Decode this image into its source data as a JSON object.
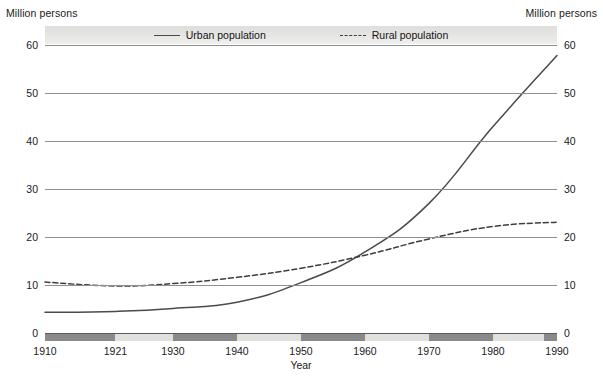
{
  "labels": {
    "unit_left": "Million persons",
    "unit_right": "Million persons"
  },
  "legend": {
    "position": "top-center",
    "entries": [
      {
        "label": "Urban population",
        "style": "solid",
        "color": "#4a4a4a"
      },
      {
        "label": "Rural population",
        "style": "dashed",
        "color": "#3d3d3d"
      }
    ]
  },
  "axes": {
    "x_title": "Year",
    "x_ticks": [
      "1910",
      "1921",
      "1930",
      "1940",
      "1950",
      "1960",
      "1970",
      "1980",
      "1990"
    ],
    "y_ticks_left": [
      "60",
      "50",
      "40",
      "30",
      "20",
      "10",
      "0"
    ],
    "y_ticks_right": [
      "60",
      "50",
      "40",
      "30",
      "20",
      "10",
      "0"
    ]
  },
  "chart_data": {
    "type": "line",
    "title": "",
    "subtitle": "",
    "xlabel": "Year",
    "ylabel": "Million persons",
    "y2label": "Million persons",
    "xlim": [
      1910,
      1990
    ],
    "ylim": [
      0,
      60
    ],
    "yticks": [
      0,
      10,
      20,
      30,
      40,
      50,
      60
    ],
    "xticks": [
      1910,
      1921,
      1930,
      1940,
      1950,
      1960,
      1970,
      1980,
      1990
    ],
    "grid": "horizontal",
    "legend_position": "top-center",
    "x": [
      1910,
      1921,
      1930,
      1940,
      1950,
      1960,
      1970,
      1980,
      1990
    ],
    "series": [
      {
        "name": "Urban population",
        "style": "solid",
        "color": "#4a4a4a",
        "values": [
          4.3,
          4.5,
          5.1,
          6.4,
          10.5,
          16.9,
          27.0,
          43.0,
          57.8
        ]
      },
      {
        "name": "Rural population",
        "style": "dashed",
        "color": "#3d3d3d",
        "values": [
          10.6,
          9.8,
          10.3,
          11.6,
          13.5,
          16.2,
          19.6,
          22.2,
          23.1
        ]
      }
    ],
    "annotations": [
      {
        "text": "Urban and rural series cross near 1960 at about 17 million persons"
      }
    ]
  },
  "axis_bands": [
    {
      "from": 1910,
      "to": 1921,
      "shade": "dark"
    },
    {
      "from": 1921,
      "to": 1930,
      "shade": "light"
    },
    {
      "from": 1930,
      "to": 1940,
      "shade": "dark"
    },
    {
      "from": 1940,
      "to": 1950,
      "shade": "light"
    },
    {
      "from": 1950,
      "to": 1960,
      "shade": "dark"
    },
    {
      "from": 1960,
      "to": 1970,
      "shade": "light"
    },
    {
      "from": 1970,
      "to": 1980,
      "shade": "dark"
    },
    {
      "from": 1980,
      "to": 1988,
      "shade": "light"
    },
    {
      "from": 1988,
      "to": 1990,
      "shade": "dark"
    }
  ],
  "colors": {
    "grid": "#8e8e8e",
    "band_dark": "#8a8a8a",
    "band_light": "#e0e0df",
    "legend_strip": "#e4e4e2",
    "text": "#1a1a1a"
  }
}
